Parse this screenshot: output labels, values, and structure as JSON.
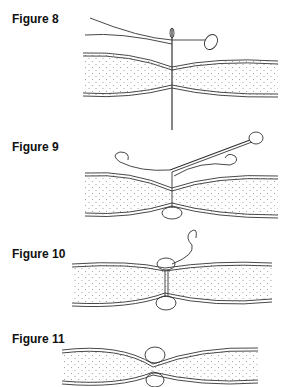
{
  "figures": [
    {
      "label": "Figure 8",
      "step": "Needle with attached button passes down through both fabric layers"
    },
    {
      "label": "Figure 9",
      "step": "Button on underside, needle drawn back up with thread loops"
    },
    {
      "label": "Figure 10",
      "step": "Buttons on both sides pulled together, thread tail above"
    },
    {
      "label": "Figure 11",
      "step": "Buttons secured, fabric layers tufted together"
    }
  ],
  "colors": {
    "line": "#333333",
    "stipple": "#888888",
    "background": "#ffffff"
  }
}
